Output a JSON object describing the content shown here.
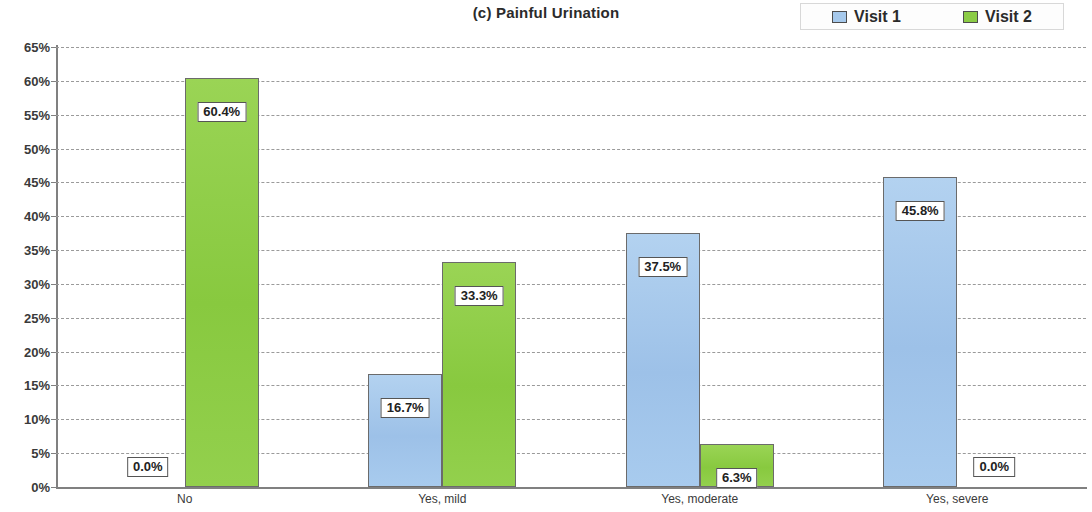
{
  "chart_data": {
    "type": "bar",
    "title": "(c) Painful Urination",
    "xlabel": "",
    "ylabel": "",
    "categories": [
      "No",
      "Yes, mild",
      "Yes, moderate",
      "Yes, severe"
    ],
    "series": [
      {
        "name": "Visit 1",
        "color": "#a6c9ec",
        "values": [
          0.0,
          16.7,
          37.5,
          45.8
        ],
        "labels": [
          "0.0%",
          "16.7%",
          "37.5%",
          "45.8%"
        ]
      },
      {
        "name": "Visit 2",
        "color": "#8ccc46",
        "values": [
          60.4,
          33.3,
          6.3,
          0.0
        ],
        "labels": [
          "60.4%",
          "33.3%",
          "6.3%",
          "0.0%"
        ]
      }
    ],
    "ylim": [
      0,
      65
    ],
    "ytick_values": [
      0,
      5,
      10,
      15,
      20,
      25,
      30,
      35,
      40,
      45,
      50,
      55,
      60,
      65
    ],
    "ytick_labels": [
      "0%",
      "5%",
      "10%",
      "15%",
      "20%",
      "25%",
      "30%",
      "35%",
      "40%",
      "45%",
      "50%",
      "55%",
      "60%",
      "65%"
    ],
    "grid": true,
    "grid_style": "dashed",
    "legend_position": "top-right",
    "legend_entries": [
      "Visit 1",
      "Visit 2"
    ]
  }
}
